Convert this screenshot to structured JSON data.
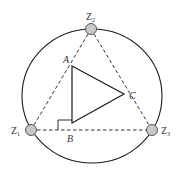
{
  "diagram": {
    "colors": {
      "stroke": "#1a1a1a",
      "node_fill": "#c8c8c8",
      "node_stroke": "#555555",
      "label": "#333333"
    },
    "circle": {
      "cx": 92,
      "cy": 96,
      "rx": 70,
      "ry": 68
    },
    "nodes": [
      {
        "id": "Z1",
        "label": "Z",
        "sub": "1",
        "x": 31,
        "y": 130
      },
      {
        "id": "Z2",
        "label": "Z",
        "sub": "2",
        "x": 91,
        "y": 29
      },
      {
        "id": "Z3",
        "label": "Z",
        "sub": "3",
        "x": 152,
        "y": 130
      }
    ],
    "triangle": {
      "vertices": [
        {
          "name": "A",
          "x": 72,
          "y": 66
        },
        {
          "name": "C",
          "x": 124,
          "y": 94
        },
        {
          "name": "right-angle",
          "x": 72,
          "y": 123
        }
      ]
    },
    "labels": {
      "A": "A",
      "B": "B",
      "C": "C",
      "Z": "Z",
      "sub1": "1",
      "sub2": "2",
      "sub3": "3"
    },
    "dashed_edges": [
      [
        "Z1",
        "Z2"
      ],
      [
        "Z2",
        "Z3"
      ],
      [
        "Z1",
        "Z3"
      ]
    ]
  }
}
